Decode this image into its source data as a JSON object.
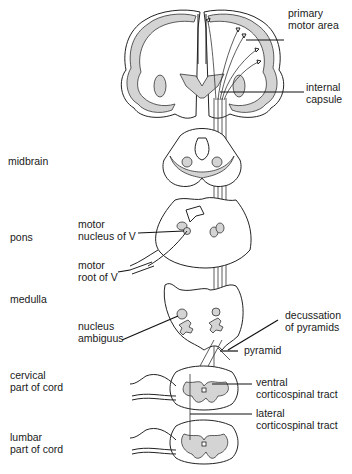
{
  "figure": {
    "left_labels": {
      "midbrain": "midbrain",
      "pons": "pons",
      "medulla": "medulla",
      "cervical": "cervical\npart of cord",
      "lumbar": "lumbar\npart of cord"
    },
    "inner_labels": {
      "motor_nucleus_v": "motor\nnucleus of V",
      "motor_root_v": "motor\nroot of V",
      "nucleus_ambiguus": "nucleus\nambiguus"
    },
    "right_labels": {
      "primary_motor_area": "primary\nmotor area",
      "internal_capsule": "internal\ncapsule",
      "decussation": "decussation\nof pyramids",
      "pyramid": "pyramid",
      "ventral_cst": "ventral\ncorticospinal tract",
      "lateral_cst": "lateral\ncorticospinal tract"
    },
    "colors": {
      "line": "#222222",
      "shading": "#d4d4d4",
      "background": "#ffffff"
    }
  }
}
